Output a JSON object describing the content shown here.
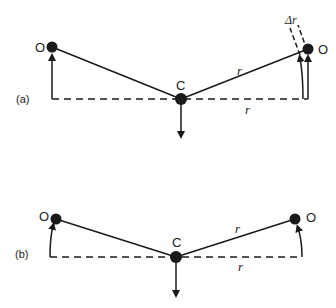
{
  "panels": [
    {
      "label": "(a)",
      "center_label": "C",
      "left_mass_label": "O",
      "right_mass_label": "O",
      "radius_label_top": "r",
      "radius_label_bottom": "r",
      "delta_label": "Δr"
    },
    {
      "label": "(b)",
      "center_label": "C",
      "left_mass_label": "O",
      "right_mass_label": "O",
      "radius_label_top": "r",
      "radius_label_bottom": "r"
    }
  ],
  "colors": {
    "ink": "#1a1a1a",
    "background": "#ffffff"
  }
}
